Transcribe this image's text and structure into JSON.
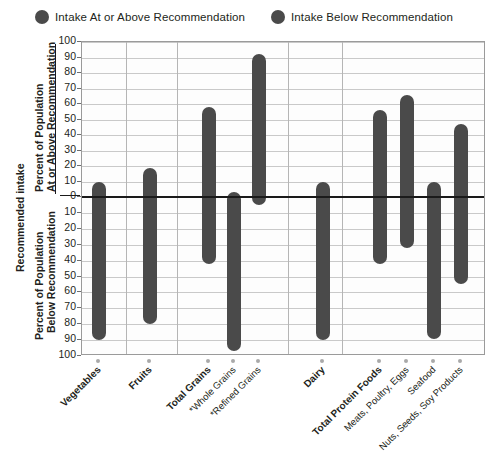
{
  "legend": {
    "items": [
      {
        "label": "Intake At or Above Recommendation",
        "color": "#4a4a4a",
        "icon": "circle-marker-icon"
      },
      {
        "label": "Intake Below Recommendation",
        "color": "#4a4a4a",
        "icon": "circle-marker-icon"
      }
    ]
  },
  "axis": {
    "outer_label": "Recommended intake",
    "upper_label_line1": "Percent of Population",
    "upper_label_line2": "At or Above Recommendation",
    "lower_label_line1": "Percent of Population",
    "lower_label_line2": "Below Recommendation",
    "upper_ticks": [
      100,
      90,
      80,
      70,
      60,
      50,
      40,
      30,
      20,
      10,
      0
    ],
    "lower_ticks": [
      0,
      10,
      20,
      30,
      40,
      50,
      60,
      70,
      80,
      90,
      100
    ]
  },
  "chart_data": {
    "type": "bar",
    "title": "",
    "subtitle": "",
    "xlabel": "",
    "ylabel": "Percent of Population",
    "ylim": [
      -100,
      100
    ],
    "grid": true,
    "legend_position": "top-center",
    "orientation": "diverging-vertical",
    "note": "Each category has one bar spanning from the percent at-or-above recommendation (upward from zero) to the percent below recommendation (downward from zero).",
    "categories": [
      "Vegetables",
      "Fruits",
      "Total Grains",
      "*Whole Grains",
      "*Refined Grains",
      "Dairy",
      "Total Protein Foods",
      "Meats, Poultry, Eggs",
      "Seafood",
      "Nuts, Seeds, Soy Products"
    ],
    "series": [
      {
        "name": "Intake At or Above Recommendation",
        "values": [
          10,
          19,
          58,
          3,
          92,
          10,
          56,
          66,
          10,
          47
        ]
      },
      {
        "name": "Intake Below Recommendation",
        "values": [
          90,
          80,
          42,
          97,
          5,
          90,
          42,
          32,
          89,
          55
        ]
      }
    ],
    "group_separators_after": [
      "Fruits",
      "Total Grains",
      "*Refined Grains",
      "Dairy"
    ]
  },
  "colors": {
    "bar": "#4a4a4a",
    "grid": "#c9c9c9",
    "frame": "#9a9a9a",
    "zero_line": "#1a1a1a",
    "text": "#231f20",
    "background": "#ffffff"
  }
}
